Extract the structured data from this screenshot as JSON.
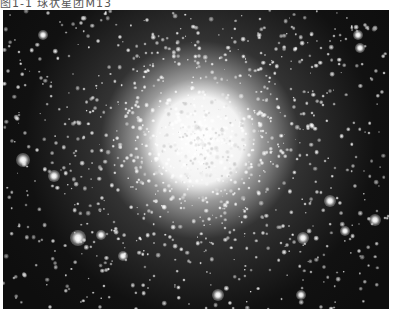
{
  "caption": {
    "text": "图1-1  球状星团M13"
  },
  "photo": {
    "subject": "globular cluster star field",
    "background_color": "#0e0e0e",
    "core_center": [
      197,
      130
    ],
    "core_radius": 62,
    "halo_radius": 175,
    "star_count": 1400,
    "seed": 1313,
    "bright_stars": [
      {
        "x": 75,
        "y": 228,
        "r": 4
      },
      {
        "x": 20,
        "y": 150,
        "r": 3.5
      },
      {
        "x": 51,
        "y": 166,
        "r": 3
      },
      {
        "x": 372,
        "y": 210,
        "r": 3
      },
      {
        "x": 327,
        "y": 191,
        "r": 3
      },
      {
        "x": 300,
        "y": 228,
        "r": 3
      },
      {
        "x": 342,
        "y": 221,
        "r": 2.5
      },
      {
        "x": 215,
        "y": 285,
        "r": 3
      },
      {
        "x": 298,
        "y": 285,
        "r": 2.5
      },
      {
        "x": 40,
        "y": 25,
        "r": 2.5
      },
      {
        "x": 355,
        "y": 25,
        "r": 2.5
      },
      {
        "x": 357,
        "y": 38,
        "r": 2.5
      },
      {
        "x": 98,
        "y": 225,
        "r": 2.5
      },
      {
        "x": 120,
        "y": 246,
        "r": 2.5
      }
    ]
  }
}
